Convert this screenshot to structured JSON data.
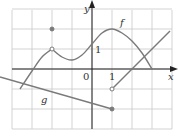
{
  "chart_data": {
    "type": "line",
    "title": "",
    "xlabel": "x",
    "ylabel": "y",
    "xlim": [
      -4.6,
      4.0
    ],
    "ylim": [
      -3.0,
      3.4
    ],
    "grid": true,
    "tick_labels": {
      "origin": "0",
      "x_one": "1",
      "y_one": "1"
    },
    "series": [
      {
        "name": "f",
        "label": "f",
        "kind": "curve",
        "points": [
          [
            -3.6,
            -1.0
          ],
          [
            -3.0,
            -0.1
          ],
          [
            -2.5,
            0.6
          ],
          [
            -2.0,
            1.0
          ],
          [
            -1.5,
            0.6
          ],
          [
            -1.0,
            0.45
          ],
          [
            -0.5,
            0.7
          ],
          [
            0.0,
            1.25
          ],
          [
            0.5,
            1.8
          ],
          [
            1.0,
            2.0
          ],
          [
            1.5,
            1.8
          ],
          [
            2.0,
            1.4
          ],
          [
            2.5,
            0.8
          ],
          [
            3.0,
            0.0
          ]
        ],
        "markers": [
          {
            "x": -2,
            "y": 1,
            "type": "open"
          },
          {
            "x": -2,
            "y": 2,
            "type": "filled"
          }
        ]
      },
      {
        "name": "g",
        "label": "g",
        "kind": "piecewise-linear",
        "segments": [
          {
            "from": [
              -4.6,
              -0.4
            ],
            "to": [
              1,
              -2
            ],
            "end_marker": "filled"
          },
          {
            "from": [
              1,
              -1
            ],
            "to": [
              3.9,
              1.9
            ],
            "start_marker": "open"
          }
        ]
      }
    ],
    "colors": {
      "curve": "#7a7a7a",
      "grid": "#c8c8c8",
      "axis": "#222222"
    }
  }
}
